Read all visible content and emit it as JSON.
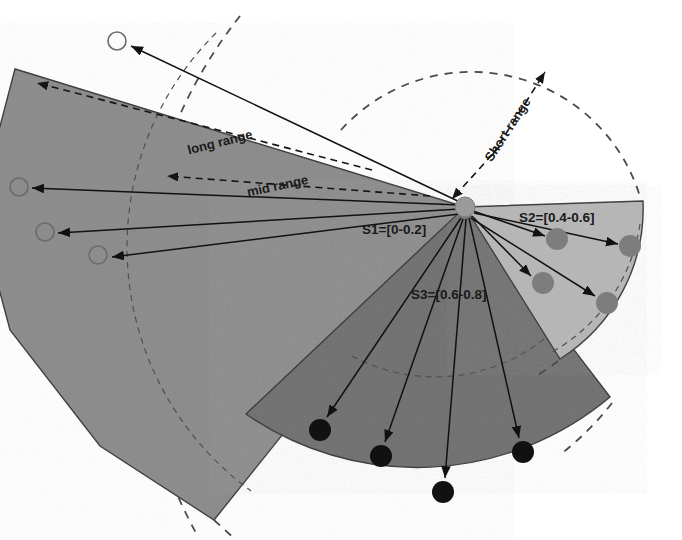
{
  "figure": {
    "background_color": "#ffffff",
    "center": {
      "x": 465,
      "y": 207
    }
  },
  "colors": {
    "sector_s1_fill": "#8a8a8a",
    "sector_s2_fill": "#b6b6b6",
    "sector_s3_fill": "#6f6f6f",
    "sector_stroke": "#3a3a3a",
    "hub_fill": "#9a9a9a",
    "arrow_color": "#111111",
    "dashed_arc_color": "#4a4a4a",
    "target_dark": "#111111",
    "target_medium": "#7d7d7d",
    "target_hollow_stroke": "#6b6b6b",
    "label_color": "#1a1a1a"
  },
  "labels": {
    "long_range": "long range",
    "mid_range": "mid range",
    "short_range": "Short range",
    "sector_s1": "S1=[0-0.2]",
    "sector_s2": "S2=[0.4-0.6]",
    "sector_s3": "S3=[0.6-0.8]"
  },
  "sectors": [
    {
      "id": "S1",
      "label": "S1=[0-0.2]",
      "fill": "#8a8a8a",
      "radius": 470,
      "start_angle_deg": 163,
      "end_angle_deg": 224,
      "target_count": 4,
      "target_style": "hollow",
      "label_pos": {
        "x": 362,
        "y": 234
      }
    },
    {
      "id": "S2",
      "label": "S2=[0.4-0.6]",
      "fill": "#b6b6b6",
      "radius": 178,
      "start_angle_deg": -2,
      "end_angle_deg": 58,
      "target_count": 4,
      "target_style": "filled-medium",
      "label_pos": {
        "x": 519,
        "y": 222
      }
    },
    {
      "id": "S3",
      "label": "S3=[0.6-0.8]",
      "fill": "#6f6f6f",
      "radius": 300,
      "start_angle_deg": 63,
      "end_angle_deg": 122,
      "target_count": 4,
      "target_style": "filled-dark",
      "label_pos": {
        "x": 411,
        "y": 299
      }
    }
  ],
  "range_rings": [
    {
      "name": "short range",
      "radius": 176,
      "style": "dashed"
    },
    {
      "name": "mid range",
      "radius": 302,
      "style": "dashed"
    },
    {
      "name": "long range",
      "radius": 470,
      "style": "dashed"
    }
  ],
  "targets_s1": [
    {
      "x": 117,
      "y": 41
    },
    {
      "x": 19,
      "y": 187
    },
    {
      "x": 45,
      "y": 232
    },
    {
      "x": 98,
      "y": 255
    }
  ],
  "targets_s2": [
    {
      "x": 557,
      "y": 239
    },
    {
      "x": 630,
      "y": 246
    },
    {
      "x": 543,
      "y": 283
    },
    {
      "x": 607,
      "y": 303
    }
  ],
  "targets_s3": [
    {
      "x": 320,
      "y": 430
    },
    {
      "x": 381,
      "y": 456
    },
    {
      "x": 443,
      "y": 492
    },
    {
      "x": 523,
      "y": 452
    }
  ]
}
